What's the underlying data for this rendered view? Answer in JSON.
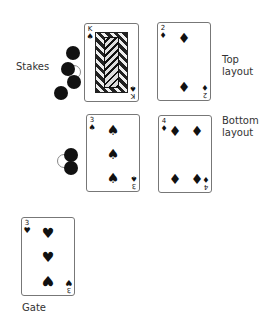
{
  "labels": {
    "stakes": "Stakes",
    "top_layout": [
      "Top",
      "layout"
    ],
    "bottom_layout": [
      "Bottom",
      "layout"
    ],
    "gate": "Gate"
  },
  "cards": {
    "king_spades": {
      "rank": "K",
      "suit": "♠",
      "suit_name": "spades",
      "type": "face"
    },
    "two_diamonds": {
      "rank": "2",
      "suit": "♦",
      "suit_name": "diamonds"
    },
    "three_spades": {
      "rank": "3",
      "suit": "♠",
      "suit_name": "spades"
    },
    "four_diamonds": {
      "rank": "4",
      "suit": "♦",
      "suit_name": "diamonds"
    },
    "three_hearts": {
      "rank": "3",
      "suit": "♥",
      "suit_name": "hearts"
    }
  },
  "chips": {
    "stakes": [
      "black",
      "black",
      "white",
      "black",
      "black"
    ],
    "bottom": [
      "black",
      "white",
      "black"
    ]
  },
  "colors": {
    "ink": "#111111",
    "border": "#777777",
    "text": "#333333"
  }
}
